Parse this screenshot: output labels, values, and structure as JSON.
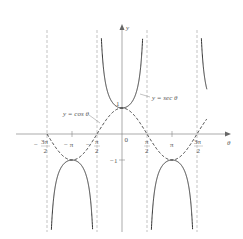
{
  "chart_data": {
    "type": "line",
    "title": "",
    "xlabel": "θ",
    "ylabel": "y",
    "xlim": [
      -5.2,
      5.8
    ],
    "ylim": [
      -4.0,
      4.5
    ],
    "grid": false,
    "legend_position": "annotations",
    "series": [
      {
        "name": "y = sec θ",
        "style": "solid",
        "function": "sec(x)"
      },
      {
        "name": "y = cos θ",
        "style": "dashed",
        "function": "cos(x)"
      }
    ],
    "asymptotes": [
      "-3π/2",
      "-π/2",
      "π/2",
      "3π/2"
    ],
    "x_ticks": [
      {
        "value": "-3π/2",
        "num": "3π",
        "den": "2",
        "sign": "−"
      },
      {
        "value": "-π",
        "label": "− π"
      },
      {
        "value": "-π/2",
        "num": "π",
        "den": "2",
        "sign": "−"
      },
      {
        "value": "0",
        "label": "0"
      },
      {
        "value": "π/2",
        "num": "π",
        "den": "2",
        "sign": ""
      },
      {
        "value": "π",
        "label": "π"
      },
      {
        "value": "3π/2",
        "num": "3π",
        "den": "2",
        "sign": ""
      }
    ],
    "y_ticks": [
      {
        "value": 1,
        "label": "1"
      },
      {
        "value": -1,
        "label": "−1"
      }
    ]
  },
  "labels": {
    "sec": "y = sec θ",
    "cos": "y = cos θ",
    "x_axis": "θ",
    "y_axis": "y",
    "origin": "0",
    "one": "1",
    "minus_one": "−1",
    "minus": "−",
    "neg_3pi_num": "3π",
    "neg_pi": "− π",
    "neg_pi2_num": "π",
    "pi2_num": "π",
    "pi": "π",
    "pi3_2_num": "3π",
    "den": "2"
  }
}
